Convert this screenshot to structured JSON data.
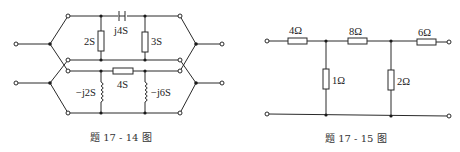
{
  "figures": [
    {
      "caption": "题 17 - 14 图",
      "upper_network": {
        "shunt_left": "2S",
        "series": "j4S",
        "shunt_right": "3S"
      },
      "lower_network": {
        "shunt_left": "−j2S",
        "series": "4S",
        "shunt_right": "−j6S"
      }
    },
    {
      "caption": "题 17 - 15 图",
      "series_1": "4Ω",
      "series_2": "8Ω",
      "series_3": "6Ω",
      "shunt_1": "1Ω",
      "shunt_2": "2Ω"
    }
  ]
}
